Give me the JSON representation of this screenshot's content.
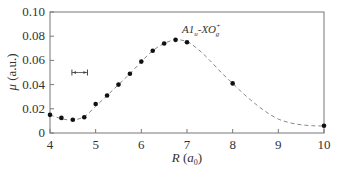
{
  "chart_data": {
    "type": "scatter",
    "title": "",
    "xlabel": "R (a0)",
    "xlabel_main": "R",
    "xlabel_unit": "a",
    "xlabel_unit_sub": "0",
    "ylabel": "μ (a.u.)",
    "ylabel_main": "μ",
    "ylabel_unit": "(a.u.)",
    "xlim": [
      4,
      10
    ],
    "ylim": [
      0,
      0.1
    ],
    "x_ticks": [
      4,
      5,
      6,
      7,
      8,
      9,
      10
    ],
    "x_tick_labels": [
      "4",
      "5",
      "6",
      "7",
      "8",
      "9",
      "10"
    ],
    "y_ticks": [
      0,
      0.02,
      0.04,
      0.06,
      0.08,
      0.1
    ],
    "y_tick_labels": [
      "0",
      "0.02",
      "0.04",
      "0.06",
      "0.08",
      "0.10"
    ],
    "grid": false,
    "legend": null,
    "annotation": {
      "text_main": "A1",
      "text_sub1": "u",
      "text_mid": "-XO",
      "text_sup": "+",
      "text_sub2": "g",
      "x": 7.0,
      "y": 0.083
    },
    "error_bar": {
      "x_start": 4.48,
      "x_end": 4.82,
      "y": 0.05
    },
    "series": [
      {
        "name": "A1u-XO+g transition dipole",
        "style": "points",
        "x": [
          4.0,
          4.25,
          4.5,
          4.75,
          5.0,
          5.25,
          5.5,
          5.75,
          6.0,
          6.25,
          6.5,
          6.75,
          7.0,
          8.0,
          10.0
        ],
        "y": [
          0.015,
          0.0125,
          0.011,
          0.013,
          0.024,
          0.031,
          0.04,
          0.049,
          0.059,
          0.068,
          0.074,
          0.077,
          0.075,
          0.041,
          0.006
        ]
      },
      {
        "name": "fit curve",
        "style": "dashed-line",
        "x": [
          4.0,
          4.25,
          4.5,
          4.75,
          5.0,
          5.25,
          5.5,
          5.75,
          6.0,
          6.25,
          6.5,
          6.75,
          7.0,
          7.25,
          7.5,
          7.75,
          8.0,
          8.25,
          8.5,
          8.75,
          9.0,
          9.25,
          9.5,
          9.75,
          10.0
        ],
        "y": [
          0.015,
          0.0118,
          0.0108,
          0.0135,
          0.022,
          0.031,
          0.04,
          0.049,
          0.059,
          0.068,
          0.074,
          0.077,
          0.0755,
          0.069,
          0.06,
          0.05,
          0.041,
          0.032,
          0.024,
          0.017,
          0.0115,
          0.0085,
          0.0068,
          0.006,
          0.0058
        ]
      }
    ]
  }
}
